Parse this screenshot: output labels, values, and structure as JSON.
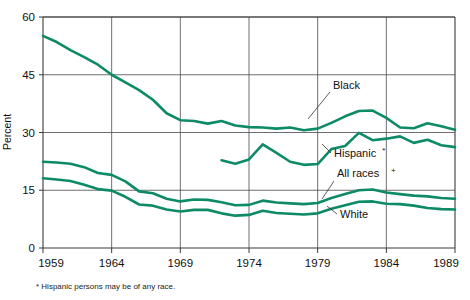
{
  "chart_data": {
    "type": "line",
    "title": "",
    "xlabel": "",
    "ylabel": "Percent",
    "xlim": [
      1959,
      1989
    ],
    "ylim": [
      0,
      60
    ],
    "yticks": [
      0,
      15,
      30,
      45,
      60
    ],
    "xticks": [
      1959,
      1964,
      1969,
      1974,
      1979,
      1984,
      1989
    ],
    "grid": true,
    "legend_position": "inline-annotations",
    "accent_color": "#0d8a66",
    "axis_color": "#3b3b3b",
    "annotations": [
      {
        "text": "Black",
        "series": "Black"
      },
      {
        "text": "Hispanic",
        "sup": "*",
        "series": "Hispanic"
      },
      {
        "text": "All races",
        "sup": "+",
        "series": "All races"
      },
      {
        "text": "White",
        "series": "White"
      }
    ],
    "footnote": "* Hispanic persons may be of any race.",
    "series": [
      {
        "name": "Black",
        "x": [
          1959,
          1960,
          1961,
          1962,
          1963,
          1964,
          1965,
          1966,
          1967,
          1968,
          1969,
          1970,
          1971,
          1972,
          1973,
          1974,
          1975,
          1976,
          1977,
          1978,
          1979,
          1980,
          1981,
          1982,
          1983,
          1984,
          1985,
          1986,
          1987,
          1988,
          1989
        ],
        "values": [
          55.1,
          53.5,
          51.4,
          49.6,
          47.6,
          45.0,
          43.0,
          41.0,
          38.5,
          35.0,
          33.2,
          33.0,
          32.3,
          33.0,
          31.8,
          31.4,
          31.3,
          31.0,
          31.3,
          30.6,
          31.0,
          32.5,
          34.2,
          35.6,
          35.7,
          33.8,
          31.3,
          31.1,
          32.4,
          31.6,
          30.7
        ]
      },
      {
        "name": "Hispanic",
        "x": [
          1972,
          1973,
          1974,
          1975,
          1976,
          1977,
          1978,
          1979,
          1980,
          1981,
          1982,
          1983,
          1984,
          1985,
          1986,
          1987,
          1988,
          1989
        ],
        "values": [
          22.8,
          21.9,
          23.0,
          26.9,
          24.7,
          22.4,
          21.6,
          21.8,
          25.7,
          26.5,
          29.9,
          28.0,
          28.4,
          29.0,
          27.3,
          28.1,
          26.7,
          26.2
        ]
      },
      {
        "name": "All races",
        "x": [
          1959,
          1960,
          1961,
          1962,
          1963,
          1964,
          1965,
          1966,
          1967,
          1968,
          1969,
          1970,
          1971,
          1972,
          1973,
          1974,
          1975,
          1976,
          1977,
          1978,
          1979,
          1980,
          1981,
          1982,
          1983,
          1984,
          1985,
          1986,
          1987,
          1988,
          1989
        ],
        "values": [
          22.4,
          22.2,
          21.9,
          21.0,
          19.5,
          19.0,
          17.3,
          14.7,
          14.2,
          12.8,
          12.1,
          12.6,
          12.5,
          11.9,
          11.1,
          11.2,
          12.3,
          11.8,
          11.6,
          11.4,
          11.7,
          13.0,
          14.0,
          15.0,
          15.2,
          14.4,
          14.0,
          13.6,
          13.4,
          13.0,
          12.8
        ]
      },
      {
        "name": "White",
        "x": [
          1959,
          1960,
          1961,
          1962,
          1963,
          1964,
          1965,
          1966,
          1967,
          1968,
          1969,
          1970,
          1971,
          1972,
          1973,
          1974,
          1975,
          1976,
          1977,
          1978,
          1979,
          1980,
          1981,
          1982,
          1983,
          1984,
          1985,
          1986,
          1987,
          1988,
          1989
        ],
        "values": [
          18.1,
          17.8,
          17.4,
          16.4,
          15.3,
          14.9,
          13.3,
          11.3,
          11.0,
          10.0,
          9.5,
          9.9,
          9.9,
          9.0,
          8.4,
          8.6,
          9.7,
          9.1,
          8.9,
          8.7,
          9.0,
          10.2,
          11.1,
          12.0,
          12.1,
          11.5,
          11.4,
          11.0,
          10.4,
          10.1,
          10.0
        ]
      }
    ]
  }
}
